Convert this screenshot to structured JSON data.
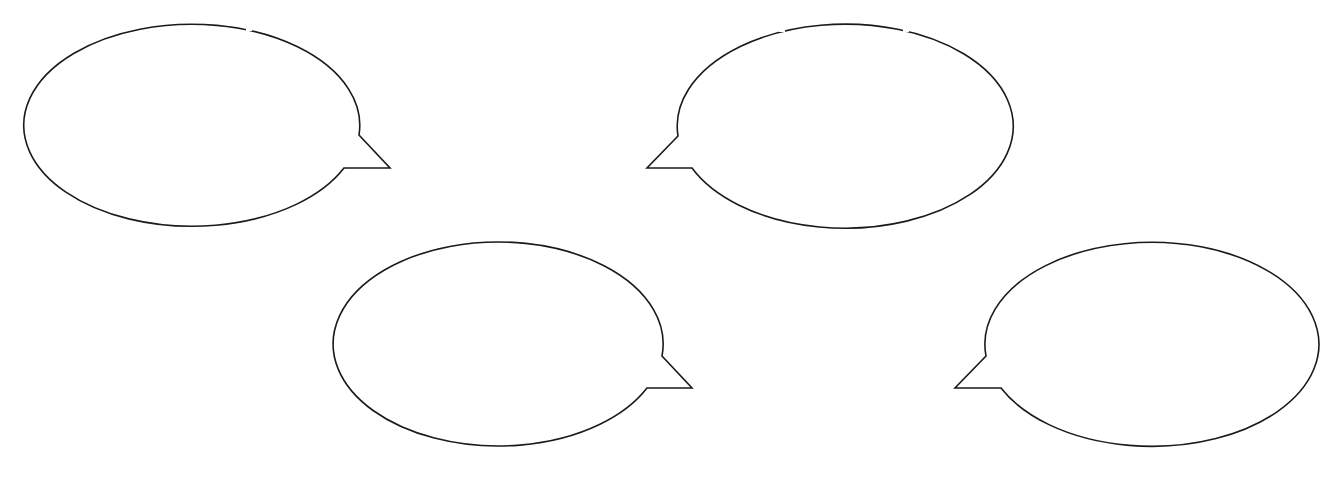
{
  "diagram": {
    "type": "speech-bubbles",
    "background": "#ffffff",
    "stroke_color": "#1a1a1a",
    "bubbles": [
      {
        "id": "bubble-1",
        "text": "",
        "cx": 193,
        "cy": 124,
        "rx": 168,
        "ry": 101,
        "tail_side": "right",
        "tail": [
          [
            359,
            135
          ],
          [
            390,
            168
          ],
          [
            344,
            168
          ]
        ],
        "top_gaps": [
          [
            118,
            124
          ],
          [
            244,
            252
          ]
        ]
      },
      {
        "id": "bubble-2",
        "text": "",
        "cx": 845,
        "cy": 125,
        "rx": 168,
        "ry": 102,
        "tail_side": "left",
        "tail": [
          [
            678,
            136
          ],
          [
            647,
            168
          ],
          [
            692,
            168
          ]
        ],
        "top_gaps": [
          [
            777,
            786
          ],
          [
            901,
            910
          ]
        ]
      },
      {
        "id": "bubble-3",
        "text": "",
        "cx": 496,
        "cy": 343,
        "rx": 165,
        "ry": 102,
        "tail_side": "right",
        "tail": [
          [
            662,
            356
          ],
          [
            692,
            388
          ],
          [
            647,
            388
          ]
        ],
        "top_gaps": []
      },
      {
        "id": "bubble-4",
        "text": "",
        "cx": 1152,
        "cy": 346,
        "rx": 167,
        "ry": 102,
        "tail_side": "left",
        "tail": [
          [
            986,
            356
          ],
          [
            955,
            388
          ],
          [
            1001,
            388
          ]
        ],
        "top_gaps": []
      }
    ]
  }
}
